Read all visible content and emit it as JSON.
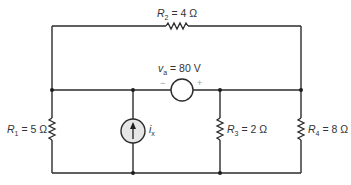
{
  "diagram": {
    "type": "circuit",
    "corner_mark": "",
    "components": {
      "R1": {
        "symbol": "R",
        "subscript": "1",
        "value": " = 5 Ω"
      },
      "R2": {
        "symbol": "R",
        "subscript": "2",
        "value": " = 4 Ω"
      },
      "R3": {
        "symbol": "R",
        "subscript": "3",
        "value": " = 2 Ω"
      },
      "R4": {
        "symbol": "R",
        "subscript": "4",
        "value": " = 8 Ω"
      },
      "va": {
        "symbol": "v",
        "subscript": "a",
        "value": " = 80 V",
        "minus": "−",
        "plus": "+"
      },
      "ix": {
        "symbol": "i",
        "subscript": "x"
      }
    },
    "colors": {
      "wire": "#2b2b2b",
      "source_fill": "#e6e6e6",
      "background": "#ffffff"
    }
  }
}
